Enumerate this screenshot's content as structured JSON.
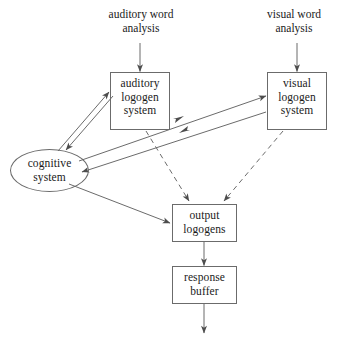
{
  "diagram": {
    "canvas": {
      "width": 351,
      "height": 341,
      "background": "#ffffff"
    },
    "stroke_color": "#6b6b6b",
    "text_color": "#1a1a1a",
    "nodes": [
      {
        "id": "auditory-word-analysis",
        "label": "auditory word\nanalysis",
        "shape": "text",
        "x": 96,
        "y": 8,
        "w": 90,
        "h": 30
      },
      {
        "id": "visual-word-analysis",
        "label": "visual word\nanalysis",
        "shape": "text",
        "x": 252,
        "y": 8,
        "w": 84,
        "h": 30
      },
      {
        "id": "auditory-logogen-system",
        "label": "auditory\nlogogen\nsystem",
        "shape": "rect",
        "x": 110,
        "y": 72,
        "w": 60,
        "h": 58
      },
      {
        "id": "visual-logogen-system",
        "label": "visual\nlogogen\nsystem",
        "shape": "rect",
        "x": 267,
        "y": 72,
        "w": 60,
        "h": 58
      },
      {
        "id": "cognitive-system",
        "label": "cognitive\nsystem",
        "shape": "ellipse",
        "x": 10,
        "y": 149,
        "w": 79,
        "h": 43
      },
      {
        "id": "output-logogens",
        "label": "output\nlogogens",
        "shape": "rect",
        "x": 172,
        "y": 204,
        "w": 65,
        "h": 38
      },
      {
        "id": "response-buffer",
        "label": "response\nbuffer",
        "shape": "rect",
        "x": 172,
        "y": 266,
        "w": 65,
        "h": 38
      }
    ],
    "edges": [
      {
        "id": "edge-auditory-input",
        "from": "auditory-word-analysis",
        "to": "auditory-logogen-system",
        "style": "solid",
        "arrow": "end"
      },
      {
        "id": "edge-visual-input",
        "from": "visual-word-analysis",
        "to": "visual-logogen-system",
        "style": "solid",
        "arrow": "end"
      },
      {
        "id": "edge-auditory-to-cognitive",
        "from": "auditory-logogen-system",
        "to": "cognitive-system",
        "style": "solid",
        "arrow": "end"
      },
      {
        "id": "edge-cognitive-to-auditory",
        "from": "cognitive-system",
        "to": "auditory-logogen-system",
        "style": "solid",
        "arrow": "end"
      },
      {
        "id": "edge-visual-to-cognitive",
        "from": "visual-logogen-system",
        "to": "cognitive-system",
        "style": "solid",
        "arrow": "end"
      },
      {
        "id": "edge-cognitive-to-visual",
        "from": "cognitive-system",
        "to": "visual-logogen-system",
        "style": "solid",
        "arrow": "end"
      },
      {
        "id": "edge-auditory-to-output",
        "from": "auditory-logogen-system",
        "to": "output-logogens",
        "style": "dashed",
        "arrow": "end"
      },
      {
        "id": "edge-visual-to-output",
        "from": "visual-logogen-system",
        "to": "output-logogens",
        "style": "dashed",
        "arrow": "end"
      },
      {
        "id": "edge-cognitive-to-output",
        "from": "cognitive-system",
        "to": "output-logogens",
        "style": "solid",
        "arrow": "end"
      },
      {
        "id": "edge-output-to-buffer",
        "from": "output-logogens",
        "to": "response-buffer",
        "style": "solid",
        "arrow": "end"
      },
      {
        "id": "edge-buffer-out",
        "from": "response-buffer",
        "to": "speech-output",
        "style": "solid",
        "arrow": "end"
      }
    ]
  }
}
